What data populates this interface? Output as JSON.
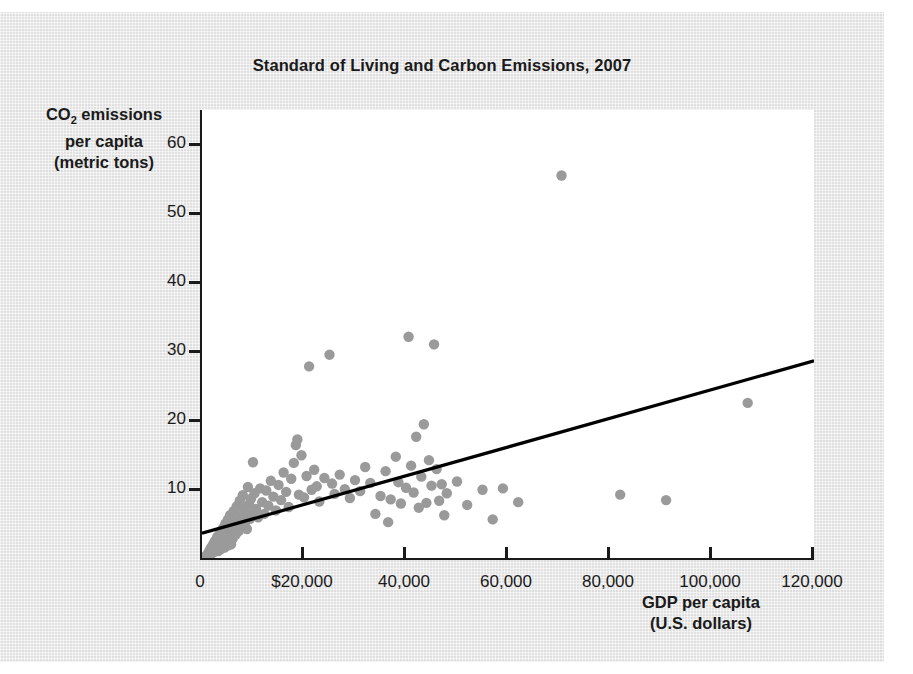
{
  "chart_data": {
    "type": "scatter",
    "title": "Standard of Living and Carbon Emissions, 2007",
    "xlabel_line1": "GDP per capita",
    "xlabel_line2": "(U.S. dollars)",
    "ylabel_line1_pre": "CO",
    "ylabel_line1_sub": "2",
    "ylabel_line1_post": " emissions",
    "ylabel_line2": "per capita",
    "ylabel_line3": "(metric tons)",
    "xlim": [
      0,
      120000
    ],
    "ylim": [
      0,
      65
    ],
    "grid": false,
    "legend": null,
    "point_color": "#9a9a9a",
    "trendline_color": "#000000",
    "axis_color": "#1a1a1a",
    "background_color": "#e6e6e6",
    "plot_background_color": "#ffffff",
    "xticks": [
      0,
      20000,
      40000,
      60000,
      80000,
      100000,
      120000
    ],
    "xtick_labels": [
      "0",
      "$20,000",
      "40,000",
      "60,000",
      "80,000",
      "100,000",
      "120,000"
    ],
    "yticks": [
      10,
      20,
      30,
      40,
      50,
      60
    ],
    "ytick_labels": [
      "10",
      "20",
      "30",
      "40",
      "50",
      "60"
    ],
    "trendline": {
      "x0": 0,
      "y0": 3.6,
      "x1": 120000,
      "y1": 28.6
    },
    "points": [
      [
        800,
        0.3
      ],
      [
        900,
        0.2
      ],
      [
        1000,
        0.4
      ],
      [
        1100,
        0.5
      ],
      [
        1200,
        0.3
      ],
      [
        1300,
        0.8
      ],
      [
        1400,
        0.6
      ],
      [
        1500,
        1.1
      ],
      [
        1600,
        0.4
      ],
      [
        1700,
        1.4
      ],
      [
        1800,
        0.9
      ],
      [
        1900,
        1.6
      ],
      [
        2000,
        0.7
      ],
      [
        2100,
        1.2
      ],
      [
        2200,
        2.0
      ],
      [
        2300,
        1.5
      ],
      [
        2400,
        0.9
      ],
      [
        2500,
        2.4
      ],
      [
        2600,
        1.8
      ],
      [
        2700,
        1.1
      ],
      [
        2800,
        2.7
      ],
      [
        2900,
        1.4
      ],
      [
        3000,
        3.1
      ],
      [
        3100,
        2.2
      ],
      [
        3200,
        1.0
      ],
      [
        3300,
        2.9
      ],
      [
        3400,
        1.7
      ],
      [
        3500,
        3.6
      ],
      [
        3600,
        2.5
      ],
      [
        3700,
        1.3
      ],
      [
        3800,
        4.0
      ],
      [
        3900,
        2.1
      ],
      [
        4000,
        3.3
      ],
      [
        4100,
        1.9
      ],
      [
        4200,
        4.4
      ],
      [
        4300,
        2.8
      ],
      [
        4400,
        1.5
      ],
      [
        4500,
        3.8
      ],
      [
        4600,
        5.0
      ],
      [
        4700,
        2.3
      ],
      [
        4800,
        4.1
      ],
      [
        4900,
        3.0
      ],
      [
        5000,
        1.8
      ],
      [
        5100,
        5.6
      ],
      [
        5200,
        3.5
      ],
      [
        5300,
        2.6
      ],
      [
        5400,
        4.7
      ],
      [
        5500,
        6.2
      ],
      [
        5600,
        3.2
      ],
      [
        5700,
        2.0
      ],
      [
        5800,
        5.3
      ],
      [
        5900,
        4.3
      ],
      [
        6000,
        2.8
      ],
      [
        6200,
        6.8
      ],
      [
        6400,
        4.9
      ],
      [
        6600,
        3.4
      ],
      [
        6800,
        7.5
      ],
      [
        7000,
        5.4
      ],
      [
        7200,
        3.9
      ],
      [
        7400,
        8.3
      ],
      [
        7600,
        6.0
      ],
      [
        7800,
        4.5
      ],
      [
        8000,
        9.1
      ],
      [
        8200,
        6.6
      ],
      [
        8400,
        5.1
      ],
      [
        8600,
        7.2
      ],
      [
        8800,
        4.2
      ],
      [
        9000,
        10.3
      ],
      [
        9200,
        7.8
      ],
      [
        9400,
        5.7
      ],
      [
        9600,
        8.6
      ],
      [
        9800,
        6.3
      ],
      [
        10000,
        13.9
      ],
      [
        10300,
        9.4
      ],
      [
        10600,
        7.1
      ],
      [
        11000,
        5.9
      ],
      [
        11400,
        10.1
      ],
      [
        11800,
        8.1
      ],
      [
        12200,
        6.4
      ],
      [
        12600,
        9.8
      ],
      [
        13000,
        7.6
      ],
      [
        13500,
        11.2
      ],
      [
        14000,
        8.9
      ],
      [
        14500,
        6.9
      ],
      [
        15000,
        10.6
      ],
      [
        15500,
        8.4
      ],
      [
        16000,
        12.4
      ],
      [
        16500,
        9.6
      ],
      [
        17000,
        7.4
      ],
      [
        17500,
        11.5
      ],
      [
        18000,
        13.8
      ],
      [
        18400,
        16.4
      ],
      [
        18700,
        17.2
      ],
      [
        19000,
        9.2
      ],
      [
        19500,
        14.9
      ],
      [
        20000,
        8.8
      ],
      [
        20500,
        11.9
      ],
      [
        21000,
        27.8
      ],
      [
        21500,
        9.9
      ],
      [
        22000,
        12.8
      ],
      [
        22500,
        10.4
      ],
      [
        23000,
        8.2
      ],
      [
        24000,
        11.6
      ],
      [
        25000,
        29.5
      ],
      [
        25500,
        10.8
      ],
      [
        26000,
        9.3
      ],
      [
        27000,
        12.1
      ],
      [
        28000,
        10.0
      ],
      [
        29000,
        8.7
      ],
      [
        30000,
        11.3
      ],
      [
        31000,
        9.7
      ],
      [
        32000,
        13.2
      ],
      [
        33000,
        10.9
      ],
      [
        34000,
        6.4
      ],
      [
        35000,
        9.0
      ],
      [
        36000,
        12.6
      ],
      [
        36500,
        5.2
      ],
      [
        37000,
        8.5
      ],
      [
        38000,
        14.7
      ],
      [
        38500,
        11.0
      ],
      [
        39000,
        7.9
      ],
      [
        40000,
        10.2
      ],
      [
        40500,
        32.1
      ],
      [
        41000,
        13.4
      ],
      [
        41500,
        9.5
      ],
      [
        42000,
        17.6
      ],
      [
        42500,
        7.3
      ],
      [
        43000,
        11.8
      ],
      [
        43500,
        19.4
      ],
      [
        44000,
        8.0
      ],
      [
        44500,
        14.2
      ],
      [
        45000,
        10.5
      ],
      [
        45500,
        31.0
      ],
      [
        46000,
        12.9
      ],
      [
        46500,
        8.3
      ],
      [
        47000,
        10.7
      ],
      [
        47500,
        6.2
      ],
      [
        48000,
        9.4
      ],
      [
        50000,
        11.1
      ],
      [
        52000,
        7.7
      ],
      [
        55000,
        9.9
      ],
      [
        57000,
        5.6
      ],
      [
        59000,
        10.1
      ],
      [
        62000,
        8.1
      ],
      [
        70500,
        55.5
      ],
      [
        82000,
        9.2
      ],
      [
        91000,
        8.4
      ],
      [
        107000,
        22.5
      ]
    ]
  }
}
